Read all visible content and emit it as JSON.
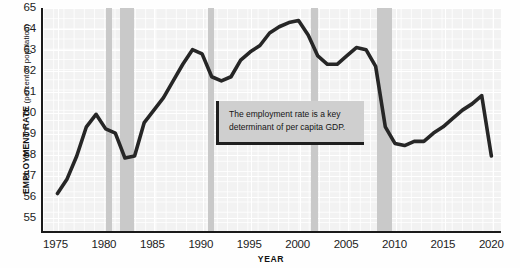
{
  "chart_data": {
    "type": "line",
    "title": "",
    "xlabel": "YEAR",
    "ylabel": "EMPLOYMENT RATE",
    "ylabel_unit": "(percent of population)",
    "xlim": [
      1973.5,
      2021
    ],
    "ylim": [
      54.3,
      65
    ],
    "grid": true,
    "legend": "none",
    "y_ticks": [
      65,
      64,
      63,
      62,
      61,
      60,
      59,
      58,
      57,
      56,
      55
    ],
    "x_ticks": [
      1975,
      1980,
      1985,
      1990,
      1995,
      2000,
      2005,
      2010,
      2015,
      2020
    ],
    "series": [
      {
        "name": "Employment rate",
        "color": "#262626",
        "x": [
          1975,
          1976,
          1977,
          1978,
          1979,
          1980,
          1981,
          1982,
          1983,
          1984,
          1985,
          1986,
          1987,
          1988,
          1989,
          1990,
          1991,
          1992,
          1993,
          1994,
          1995,
          1996,
          1997,
          1998,
          1999,
          2000,
          2001,
          2002,
          2003,
          2004,
          2005,
          2006,
          2007,
          2008,
          2009,
          2010,
          2011,
          2012,
          2013,
          2014,
          2015,
          2016,
          2017,
          2018,
          2019,
          2020
        ],
        "values": [
          56.1,
          56.8,
          57.9,
          59.3,
          59.9,
          59.2,
          59.0,
          57.8,
          57.9,
          59.5,
          60.1,
          60.7,
          61.5,
          62.3,
          63.0,
          62.8,
          61.7,
          61.5,
          61.7,
          62.5,
          62.9,
          63.2,
          63.8,
          64.1,
          64.3,
          64.4,
          63.7,
          62.7,
          62.3,
          62.3,
          62.7,
          63.1,
          63.0,
          62.2,
          59.3,
          58.5,
          58.4,
          58.6,
          58.6,
          59.0,
          59.3,
          59.7,
          60.1,
          60.4,
          60.8,
          57.9
        ]
      }
    ],
    "recession_bands": [
      {
        "label": "1980 recession",
        "start": 1980.0,
        "end": 1980.6
      },
      {
        "label": "1981-82 recession",
        "start": 1981.5,
        "end": 1982.9
      },
      {
        "label": "1990-91 recession",
        "start": 1990.5,
        "end": 1991.2
      },
      {
        "label": "2001 recession",
        "start": 2001.2,
        "end": 2001.9
      },
      {
        "label": "2008-09 recession",
        "start": 2008.0,
        "end": 2009.5
      }
    ],
    "band_color": "#c9c9c9",
    "plot_background": "#f2f2f2"
  },
  "callout": {
    "text": "The employment rate is a key determinant of per capita GDP."
  }
}
